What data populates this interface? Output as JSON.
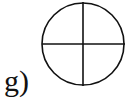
{
  "figure": {
    "label": "g)",
    "shape": "circle-with-crosshair",
    "circle": {
      "cx": 83,
      "cy": 44,
      "r": 41
    },
    "stroke_color": "#111111",
    "background": "#ffffff"
  }
}
